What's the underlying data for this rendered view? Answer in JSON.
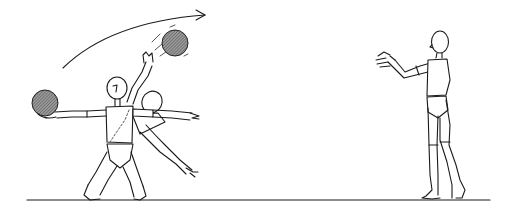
{
  "illustration": {
    "subject": "Two wooden-mannequin figures passing a ball: kneeling thrower and standing catcher",
    "colors": {
      "background": "#ffffff",
      "ink": "#1a1a1a",
      "ball_fill": "#7a7a7a"
    },
    "elements": {
      "motion_arrow": {
        "icon": "curved-arrow-right"
      },
      "ball_in_flight": {
        "icon": "hatched-ball",
        "motion_lines": true
      },
      "ball_in_hand": {
        "icon": "hatched-ball"
      },
      "thrower": {
        "pose": "kneeling, arms outstretched, ghosted rotation overlay"
      },
      "catcher": {
        "pose": "standing, arms extended forward to catch"
      },
      "ground_line": {
        "from_x": 27,
        "to_x": 490,
        "y": 200
      }
    }
  }
}
